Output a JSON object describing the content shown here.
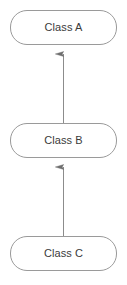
{
  "diagram": {
    "type": "class-inheritance-diagram",
    "title": "",
    "background_color": "#ffffff",
    "node_border_color": "#9a9a9a",
    "node_fill_color": "#ffffff",
    "node_text_color": "#3b3b3b",
    "connector_color": "#8c8c8c",
    "nodes": [
      {
        "id": "class-a",
        "label": "Class A",
        "shape": "rounded-rectangle"
      },
      {
        "id": "class-b",
        "label": "Class B",
        "shape": "rounded-rectangle"
      },
      {
        "id": "class-c",
        "label": "Class C",
        "shape": "rounded-rectangle"
      }
    ],
    "connectors": [
      {
        "id": "edge-b-to-a",
        "from": "class-b",
        "to": "class-a",
        "arrowhead": "open-arrow-up",
        "label": ""
      },
      {
        "id": "edge-c-to-b",
        "from": "class-c",
        "to": "class-b",
        "arrowhead": "open-arrow-up",
        "label": ""
      }
    ]
  }
}
